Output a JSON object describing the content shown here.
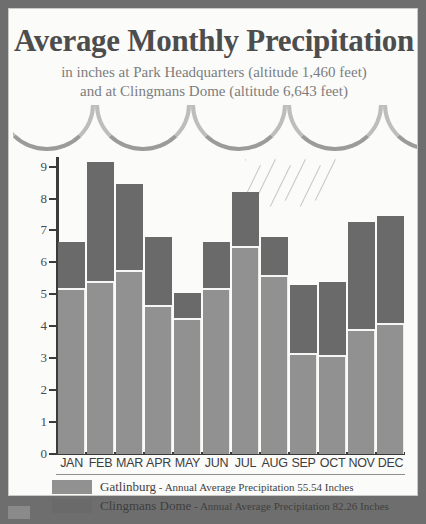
{
  "poster": {
    "title": "Average Monthly Precipitation",
    "subtitle_line1": "in inches at Park Headquarters (altitude 1,460 feet)",
    "subtitle_line2": "and at Clingmans Dome (altitude 6,643 feet)"
  },
  "colors": {
    "gatlinburg": "#919191",
    "clingmans_dome": "#6a6a6a",
    "frame_border": "#6e6e6e",
    "paper": "#fbfbfa",
    "axis": "#3b3b3b"
  },
  "legend": [
    {
      "key": "gatlinburg",
      "name": "Gatlinburg",
      "detail": " - Annual Average Precipitation 55.54 Inches",
      "swatch": "#919191"
    },
    {
      "key": "clingmans_dome",
      "name": "Clingmans Dome",
      "detail": " - Annual Average Precipitation 82.26 Inches",
      "swatch": "#6a6a6a"
    }
  ],
  "chart_data": {
    "type": "bar",
    "title": "Average Monthly Precipitation",
    "subtitle": "in inches at Park Headquarters (altitude 1,460 feet) and at Clingmans Dome (altitude 6,643 feet)",
    "stacked_overlay": true,
    "xlabel": "",
    "ylabel": "",
    "ylim": [
      0,
      9.3
    ],
    "yticks": [
      0,
      1,
      2,
      3,
      4,
      5,
      6,
      7,
      8,
      9
    ],
    "ytick_labels": [
      "0",
      "1",
      "2",
      "3",
      "4",
      "5",
      "6",
      "7",
      "8",
      "9"
    ],
    "grid": false,
    "legend_position": "bottom",
    "categories": [
      "JAN",
      "FEB",
      "MAR",
      "APR",
      "MAY",
      "JUN",
      "JUL",
      "AUG",
      "SEP",
      "OCT",
      "NOV",
      "DEC"
    ],
    "series": [
      {
        "name": "Gatlinburg",
        "color": "#919191",
        "annual_total": 55.54,
        "values": [
          5.15,
          5.35,
          5.7,
          4.6,
          4.2,
          5.15,
          6.45,
          5.55,
          3.1,
          3.05,
          3.85,
          4.05
        ]
      },
      {
        "name": "Clingmans Dome",
        "color": "#6a6a6a",
        "annual_total": 82.26,
        "values": [
          6.65,
          9.15,
          8.45,
          6.8,
          5.05,
          6.65,
          8.2,
          6.8,
          5.3,
          5.4,
          7.25,
          7.45
        ]
      }
    ]
  },
  "decor": {
    "arch_icon": "cloud-arch",
    "rain_icon": "rain-streaks"
  }
}
